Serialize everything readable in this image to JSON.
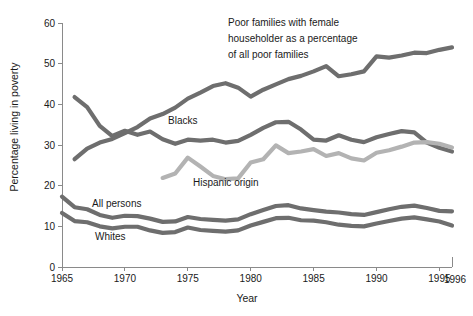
{
  "chart_data": {
    "type": "line",
    "title": "",
    "xlabel": "Year",
    "ylabel": "Percentage living in poverty",
    "xlim": [
      1965,
      1996
    ],
    "ylim": [
      0,
      60
    ],
    "grid": false,
    "legend_position": "inline-annotations",
    "x_ticks": [
      "1965",
      "1970",
      "1975",
      "1980",
      "1985",
      "1990",
      "1995"
    ],
    "x_tick_values": [
      1965,
      1970,
      1975,
      1980,
      1985,
      1990,
      1995
    ],
    "x_end_label": "1996",
    "y_ticks": [
      "0",
      "10",
      "20",
      "30",
      "40",
      "50",
      "60"
    ],
    "y_tick_values": [
      0,
      10,
      20,
      30,
      40,
      50,
      60
    ],
    "colors": {
      "dark_gray": "#6e6e6e",
      "light_gray": "#b3b3b3",
      "axis": "#8a8a8a",
      "text": "#1a1a1a",
      "background": "#ffffff"
    },
    "annotations": [
      {
        "name": "female-householder-annotation",
        "lines": [
          "Poor families with female",
          "householder as a percentage",
          "of all poor families"
        ],
        "x": 228,
        "y": 26
      }
    ],
    "series": [
      {
        "name": "Poor families with female householder as a percentage of all poor families",
        "label": "",
        "color": "#6e6e6e",
        "x": [
          1966,
          1967,
          1968,
          1969,
          1970,
          1971,
          1972,
          1973,
          1974,
          1975,
          1976,
          1977,
          1978,
          1979,
          1980,
          1981,
          1982,
          1983,
          1984,
          1985,
          1986,
          1987,
          1988,
          1989,
          1990,
          1991,
          1992,
          1993,
          1994,
          1995,
          1996
        ],
        "values": [
          26.5,
          29.1,
          30.6,
          31.5,
          32.9,
          34.4,
          36.5,
          37.6,
          39.2,
          41.4,
          42.9,
          44.5,
          45.2,
          44.1,
          41.9,
          43.6,
          44.9,
          46.2,
          47.0,
          48.1,
          49.4,
          46.9,
          47.4,
          48.1,
          51.8,
          51.5,
          52.0,
          52.7,
          52.6,
          53.4,
          54.0
        ]
      },
      {
        "name": "Blacks",
        "label": "Blacks",
        "color": "#6e6e6e",
        "label_x": 168,
        "label_y": 124,
        "x": [
          1966,
          1967,
          1968,
          1969,
          1970,
          1971,
          1972,
          1973,
          1974,
          1975,
          1976,
          1977,
          1978,
          1979,
          1980,
          1981,
          1982,
          1983,
          1984,
          1985,
          1986,
          1987,
          1988,
          1989,
          1990,
          1991,
          1992,
          1993,
          1994,
          1995,
          1996
        ],
        "values": [
          41.8,
          39.3,
          34.7,
          32.2,
          33.5,
          32.5,
          33.3,
          31.4,
          30.3,
          31.3,
          31.1,
          31.3,
          30.6,
          31.0,
          32.5,
          34.2,
          35.6,
          35.7,
          33.8,
          31.3,
          31.1,
          32.4,
          31.3,
          30.7,
          31.9,
          32.7,
          33.4,
          33.1,
          30.6,
          29.3,
          28.4
        ]
      },
      {
        "name": "Hispanic origin",
        "label": "Hispanic origin",
        "color": "#b3b3b3",
        "label_x": 193,
        "label_y": 186,
        "x": [
          1973,
          1974,
          1975,
          1976,
          1977,
          1978,
          1979,
          1980,
          1981,
          1982,
          1983,
          1984,
          1985,
          1986,
          1987,
          1988,
          1989,
          1990,
          1991,
          1992,
          1993,
          1994,
          1995,
          1996
        ],
        "values": [
          21.9,
          23.0,
          26.9,
          24.7,
          22.4,
          21.6,
          21.8,
          25.7,
          26.5,
          29.9,
          28.0,
          28.4,
          29.0,
          27.3,
          28.0,
          26.7,
          26.2,
          28.1,
          28.7,
          29.6,
          30.6,
          30.7,
          30.3,
          29.4
        ]
      },
      {
        "name": "All persons",
        "label": "All persons",
        "color": "#6e6e6e",
        "label_x": 92,
        "label_y": 207,
        "x": [
          1965,
          1966,
          1967,
          1968,
          1969,
          1970,
          1971,
          1972,
          1973,
          1974,
          1975,
          1976,
          1977,
          1978,
          1979,
          1980,
          1981,
          1982,
          1983,
          1984,
          1985,
          1986,
          1987,
          1988,
          1989,
          1990,
          1991,
          1992,
          1993,
          1994,
          1995,
          1996
        ],
        "values": [
          17.3,
          14.7,
          14.2,
          12.8,
          12.1,
          12.6,
          12.5,
          11.9,
          11.1,
          11.2,
          12.3,
          11.8,
          11.6,
          11.4,
          11.7,
          13.0,
          14.0,
          15.0,
          15.2,
          14.4,
          14.0,
          13.6,
          13.4,
          13.0,
          12.8,
          13.5,
          14.2,
          14.8,
          15.1,
          14.5,
          13.8,
          13.7
        ]
      },
      {
        "name": "Whites",
        "label": "Whites",
        "color": "#6e6e6e",
        "label_x": 95,
        "label_y": 240,
        "x": [
          1965,
          1966,
          1967,
          1968,
          1969,
          1970,
          1971,
          1972,
          1973,
          1974,
          1975,
          1976,
          1977,
          1978,
          1979,
          1980,
          1981,
          1982,
          1983,
          1984,
          1985,
          1986,
          1987,
          1988,
          1989,
          1990,
          1991,
          1992,
          1993,
          1994,
          1995,
          1996
        ],
        "values": [
          13.3,
          11.3,
          11.0,
          10.0,
          9.5,
          9.9,
          9.9,
          9.0,
          8.4,
          8.6,
          9.7,
          9.1,
          8.9,
          8.7,
          9.0,
          10.2,
          11.1,
          12.0,
          12.1,
          11.5,
          11.4,
          11.0,
          10.4,
          10.1,
          10.0,
          10.7,
          11.3,
          11.9,
          12.2,
          11.7,
          11.2,
          10.2
        ]
      }
    ]
  }
}
